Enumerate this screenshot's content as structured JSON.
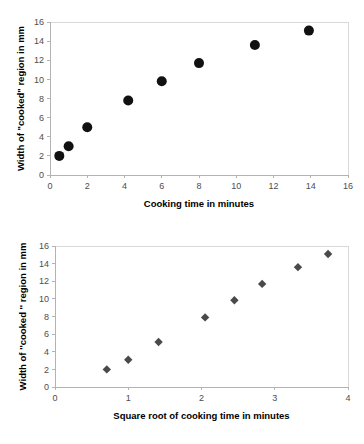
{
  "chart_data": [
    {
      "id": "top",
      "type": "scatter",
      "title": "",
      "xlabel": "Cooking time in minutes",
      "ylabel": "Width of \"cooked\" region in mm",
      "xlim": [
        0,
        16
      ],
      "ylim": [
        0,
        16
      ],
      "xticks": [
        0,
        2,
        4,
        6,
        8,
        10,
        12,
        14,
        16
      ],
      "yticks": [
        0,
        2,
        4,
        6,
        8,
        10,
        12,
        14,
        16
      ],
      "xtick_labels": [
        "0",
        "2",
        "4",
        "6",
        "8",
        "10",
        "12",
        "14",
        "16"
      ],
      "ytick_labels": [
        "0",
        "2",
        "4",
        "6",
        "8",
        "10",
        "12",
        "14",
        "16"
      ],
      "grid": false,
      "legend": "none",
      "marker": "circle",
      "marker_color": "#111111",
      "marker_size": 7,
      "x": [
        0.5,
        1.0,
        2.0,
        4.2,
        6.0,
        8.0,
        11.0,
        13.9
      ],
      "y": [
        2.0,
        3.0,
        5.0,
        7.8,
        9.8,
        11.7,
        13.6,
        15.1
      ]
    },
    {
      "id": "bottom",
      "type": "scatter",
      "title": "",
      "xlabel": "Square root of cooking time in minutes",
      "ylabel": "Width of ''cooked '' region in mm",
      "xlim": [
        0,
        4
      ],
      "ylim": [
        0,
        16
      ],
      "xticks": [
        0,
        1,
        2,
        3,
        4
      ],
      "yticks": [
        0,
        2,
        4,
        6,
        8,
        10,
        12,
        14,
        16
      ],
      "xtick_labels": [
        "0",
        "1",
        "2",
        "3",
        "4"
      ],
      "ytick_labels": [
        "0",
        "2",
        "4",
        "6",
        "8",
        "10",
        "12",
        "14",
        "16"
      ],
      "grid": false,
      "legend": "none",
      "marker": "diamond",
      "marker_color": "#4a4a4a",
      "marker_size": 6,
      "x": [
        0.707,
        1.0,
        1.414,
        2.049,
        2.449,
        2.828,
        3.317,
        3.728
      ],
      "y": [
        2.0,
        3.1,
        5.1,
        7.9,
        9.85,
        11.7,
        13.6,
        15.1
      ]
    }
  ],
  "colors": {
    "axis": "#b3b3b3",
    "frame": "#d9d9d9",
    "tick_text": "#4d4d4d",
    "title_text": "#000000",
    "background": "#ffffff"
  }
}
